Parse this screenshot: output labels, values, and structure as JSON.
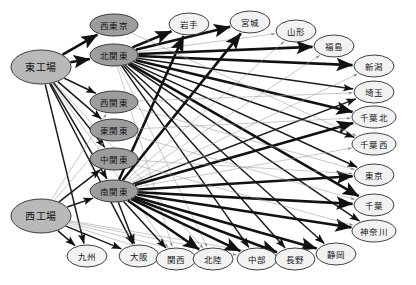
{
  "diagram": {
    "type": "directed-graph",
    "background": "#ffffff",
    "colors": {
      "source_node_fill": "#b9b9b9",
      "middle_node_fill": "#9d9d9d",
      "destination_node_fill": "#f2f2f2",
      "node_stroke": "#2b2b2b",
      "edge_thick": "#111111",
      "edge_thin": "#9a9a9a"
    },
    "nodes": [
      {
        "id": "east_factory",
        "label": "東工場",
        "x": 41,
        "y": 67,
        "rx": 30,
        "ry": 17,
        "group": "source",
        "size": "big"
      },
      {
        "id": "west_factory",
        "label": "西工場",
        "x": 41,
        "y": 216,
        "rx": 30,
        "ry": 17,
        "group": "source",
        "size": "big"
      },
      {
        "id": "nishitokyo",
        "label": "西東京",
        "x": 114,
        "y": 25,
        "rx": 24,
        "ry": 11,
        "group": "middle",
        "size": "normal"
      },
      {
        "id": "kitakanto",
        "label": "北関東",
        "x": 114,
        "y": 55,
        "rx": 24,
        "ry": 11,
        "group": "middle",
        "size": "normal"
      },
      {
        "id": "nishikanto",
        "label": "西関東",
        "x": 114,
        "y": 102,
        "rx": 24,
        "ry": 11,
        "group": "middle",
        "size": "normal"
      },
      {
        "id": "higashikanto",
        "label": "東関東",
        "x": 114,
        "y": 130,
        "rx": 24,
        "ry": 11,
        "group": "middle",
        "size": "normal"
      },
      {
        "id": "nakakanto",
        "label": "中関東",
        "x": 114,
        "y": 159,
        "rx": 24,
        "ry": 11,
        "group": "middle",
        "size": "normal"
      },
      {
        "id": "minamikanto",
        "label": "南関東",
        "x": 114,
        "y": 191,
        "rx": 24,
        "ry": 11,
        "group": "middle",
        "size": "normal"
      },
      {
        "id": "iwate",
        "label": "岩手",
        "x": 189,
        "y": 24,
        "rx": 20,
        "ry": 11,
        "group": "destination",
        "size": "normal"
      },
      {
        "id": "miyagi",
        "label": "宮城",
        "x": 250,
        "y": 22,
        "rx": 20,
        "ry": 11,
        "group": "destination",
        "size": "normal"
      },
      {
        "id": "yamagata",
        "label": "山形",
        "x": 296,
        "y": 31,
        "rx": 20,
        "ry": 11,
        "group": "destination",
        "size": "normal"
      },
      {
        "id": "fukushima",
        "label": "福島",
        "x": 334,
        "y": 46,
        "rx": 20,
        "ry": 11,
        "group": "destination",
        "size": "normal"
      },
      {
        "id": "niigata",
        "label": "新潟",
        "x": 374,
        "y": 66,
        "rx": 20,
        "ry": 11,
        "group": "destination",
        "size": "normal"
      },
      {
        "id": "saitama",
        "label": "埼玉",
        "x": 374,
        "y": 92,
        "rx": 20,
        "ry": 11,
        "group": "destination",
        "size": "normal"
      },
      {
        "id": "chibakita",
        "label": "千葉北",
        "x": 374,
        "y": 117,
        "rx": 22,
        "ry": 11,
        "group": "destination",
        "size": "normal"
      },
      {
        "id": "chibanishi",
        "label": "千葉西",
        "x": 374,
        "y": 144,
        "rx": 22,
        "ry": 11,
        "group": "destination",
        "size": "normal"
      },
      {
        "id": "tokyo",
        "label": "東京",
        "x": 374,
        "y": 175,
        "rx": 20,
        "ry": 11,
        "group": "destination",
        "size": "normal"
      },
      {
        "id": "chiba",
        "label": "千葉",
        "x": 374,
        "y": 205,
        "rx": 20,
        "ry": 11,
        "group": "destination",
        "size": "normal"
      },
      {
        "id": "kanagawa",
        "label": "神奈川",
        "x": 374,
        "y": 231,
        "rx": 22,
        "ry": 11,
        "group": "destination",
        "size": "normal"
      },
      {
        "id": "kyushu",
        "label": "九州",
        "x": 87,
        "y": 256,
        "rx": 20,
        "ry": 11,
        "group": "destination",
        "size": "normal"
      },
      {
        "id": "osaka",
        "label": "大阪",
        "x": 139,
        "y": 256,
        "rx": 20,
        "ry": 11,
        "group": "destination",
        "size": "normal"
      },
      {
        "id": "kansai",
        "label": "関西",
        "x": 176,
        "y": 259,
        "rx": 20,
        "ry": 11,
        "group": "destination",
        "size": "normal"
      },
      {
        "id": "hokuriku",
        "label": "北陸",
        "x": 213,
        "y": 259,
        "rx": 20,
        "ry": 11,
        "group": "destination",
        "size": "normal"
      },
      {
        "id": "chubu",
        "label": "中部",
        "x": 257,
        "y": 259,
        "rx": 20,
        "ry": 11,
        "group": "destination",
        "size": "normal"
      },
      {
        "id": "nagano",
        "label": "長野",
        "x": 295,
        "y": 259,
        "rx": 20,
        "ry": 11,
        "group": "destination",
        "size": "normal"
      },
      {
        "id": "shizuoka",
        "label": "静岡",
        "x": 336,
        "y": 254,
        "rx": 20,
        "ry": 11,
        "group": "destination",
        "size": "normal"
      }
    ],
    "edges": [
      {
        "from": "east_factory",
        "to": "nishitokyo",
        "weight": "thick"
      },
      {
        "from": "east_factory",
        "to": "kitakanto",
        "weight": "thick"
      },
      {
        "from": "east_factory",
        "to": "nishikanto",
        "weight": "medium"
      },
      {
        "from": "east_factory",
        "to": "higashikanto",
        "weight": "medium"
      },
      {
        "from": "east_factory",
        "to": "nakakanto",
        "weight": "medium"
      },
      {
        "from": "east_factory",
        "to": "minamikanto",
        "weight": "medium"
      },
      {
        "from": "east_factory",
        "to": "kyushu",
        "weight": "medium"
      },
      {
        "from": "east_factory",
        "to": "osaka",
        "weight": "medium"
      },
      {
        "from": "east_factory",
        "to": "kansai",
        "weight": "thin"
      },
      {
        "from": "east_factory",
        "to": "hokuriku",
        "weight": "thin"
      },
      {
        "from": "west_factory",
        "to": "nishikanto",
        "weight": "thin"
      },
      {
        "from": "west_factory",
        "to": "higashikanto",
        "weight": "thin"
      },
      {
        "from": "west_factory",
        "to": "nakakanto",
        "weight": "medium"
      },
      {
        "from": "west_factory",
        "to": "minamikanto",
        "weight": "medium"
      },
      {
        "from": "west_factory",
        "to": "kyushu",
        "weight": "medium"
      },
      {
        "from": "west_factory",
        "to": "osaka",
        "weight": "medium"
      },
      {
        "from": "west_factory",
        "to": "kansai",
        "weight": "thin"
      },
      {
        "from": "west_factory",
        "to": "hokuriku",
        "weight": "thin"
      },
      {
        "from": "west_factory",
        "to": "chubu",
        "weight": "thin"
      },
      {
        "from": "west_factory",
        "to": "nagano",
        "weight": "thin"
      },
      {
        "from": "kitakanto",
        "to": "iwate",
        "weight": "thick"
      },
      {
        "from": "kitakanto",
        "to": "miyagi",
        "weight": "thick"
      },
      {
        "from": "kitakanto",
        "to": "yamagata",
        "weight": "thin"
      },
      {
        "from": "kitakanto",
        "to": "fukushima",
        "weight": "thick"
      },
      {
        "from": "kitakanto",
        "to": "niigata",
        "weight": "thick"
      },
      {
        "from": "kitakanto",
        "to": "saitama",
        "weight": "medium"
      },
      {
        "from": "kitakanto",
        "to": "chibakita",
        "weight": "thick"
      },
      {
        "from": "kitakanto",
        "to": "chibanishi",
        "weight": "medium"
      },
      {
        "from": "kitakanto",
        "to": "tokyo",
        "weight": "medium"
      },
      {
        "from": "kitakanto",
        "to": "chiba",
        "weight": "thick"
      },
      {
        "from": "kitakanto",
        "to": "kanagawa",
        "weight": "medium"
      },
      {
        "from": "kitakanto",
        "to": "chubu",
        "weight": "medium"
      },
      {
        "from": "kitakanto",
        "to": "nagano",
        "weight": "medium"
      },
      {
        "from": "kitakanto",
        "to": "shizuoka",
        "weight": "medium"
      },
      {
        "from": "kitakanto",
        "to": "hokuriku",
        "weight": "thin"
      },
      {
        "from": "kitakanto",
        "to": "kansai",
        "weight": "thin"
      },
      {
        "from": "minamikanto",
        "to": "iwate",
        "weight": "thick"
      },
      {
        "from": "minamikanto",
        "to": "miyagi",
        "weight": "thick"
      },
      {
        "from": "minamikanto",
        "to": "yamagata",
        "weight": "thin"
      },
      {
        "from": "minamikanto",
        "to": "fukushima",
        "weight": "thin"
      },
      {
        "from": "minamikanto",
        "to": "niigata",
        "weight": "thin"
      },
      {
        "from": "minamikanto",
        "to": "saitama",
        "weight": "medium"
      },
      {
        "from": "minamikanto",
        "to": "chibakita",
        "weight": "thick"
      },
      {
        "from": "minamikanto",
        "to": "chibanishi",
        "weight": "thin"
      },
      {
        "from": "minamikanto",
        "to": "tokyo",
        "weight": "thick"
      },
      {
        "from": "minamikanto",
        "to": "chiba",
        "weight": "thick"
      },
      {
        "from": "minamikanto",
        "to": "kanagawa",
        "weight": "thick"
      },
      {
        "from": "minamikanto",
        "to": "shizuoka",
        "weight": "thick"
      },
      {
        "from": "minamikanto",
        "to": "nagano",
        "weight": "thick"
      },
      {
        "from": "minamikanto",
        "to": "chubu",
        "weight": "thick"
      },
      {
        "from": "minamikanto",
        "to": "hokuriku",
        "weight": "thick"
      },
      {
        "from": "minamikanto",
        "to": "kansai",
        "weight": "medium"
      },
      {
        "from": "minamikanto",
        "to": "osaka",
        "weight": "medium"
      },
      {
        "from": "nishitokyo",
        "to": "chibanishi",
        "weight": "thin"
      },
      {
        "from": "nishikanto",
        "to": "saitama",
        "weight": "thin"
      },
      {
        "from": "nishikanto",
        "to": "tokyo",
        "weight": "thin"
      },
      {
        "from": "higashikanto",
        "to": "chibakita",
        "weight": "thin"
      },
      {
        "from": "higashikanto",
        "to": "chiba",
        "weight": "thin"
      },
      {
        "from": "nakakanto",
        "to": "kanagawa",
        "weight": "thin"
      },
      {
        "from": "nakakanto",
        "to": "tokyo",
        "weight": "thin"
      }
    ]
  }
}
